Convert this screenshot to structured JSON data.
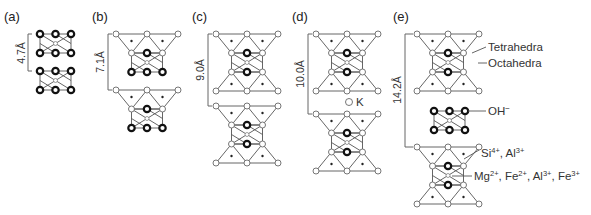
{
  "panels": [
    {
      "id": "a",
      "label": "(a)",
      "spacing": "4.7Å"
    },
    {
      "id": "b",
      "label": "(b)",
      "spacing": "7.1Å"
    },
    {
      "id": "c",
      "label": "(c)",
      "spacing": "9.0Å"
    },
    {
      "id": "d",
      "label": "(d)",
      "spacing": "10.0Å",
      "interlayer_cation": "K"
    },
    {
      "id": "e",
      "label": "(e)",
      "spacing": "14.2Å"
    }
  ],
  "annotations": {
    "tetrahedra": "Tetrahedra",
    "octahedra": "Octahedra",
    "hydroxyl": "OH",
    "hydroxyl_charge": "−",
    "tet_cations": {
      "si": "Si",
      "si_charge": "4+",
      "sep": ", ",
      "al": "Al",
      "al_charge": "3+"
    },
    "oct_cations": {
      "mg": "Mg",
      "mg_charge": "2+",
      "fe2": "Fe",
      "fe2_charge": "2+",
      "al": "Al",
      "al_charge": "3+",
      "fe3": "Fe",
      "fe3_charge": "3+",
      "sep": ", "
    }
  }
}
